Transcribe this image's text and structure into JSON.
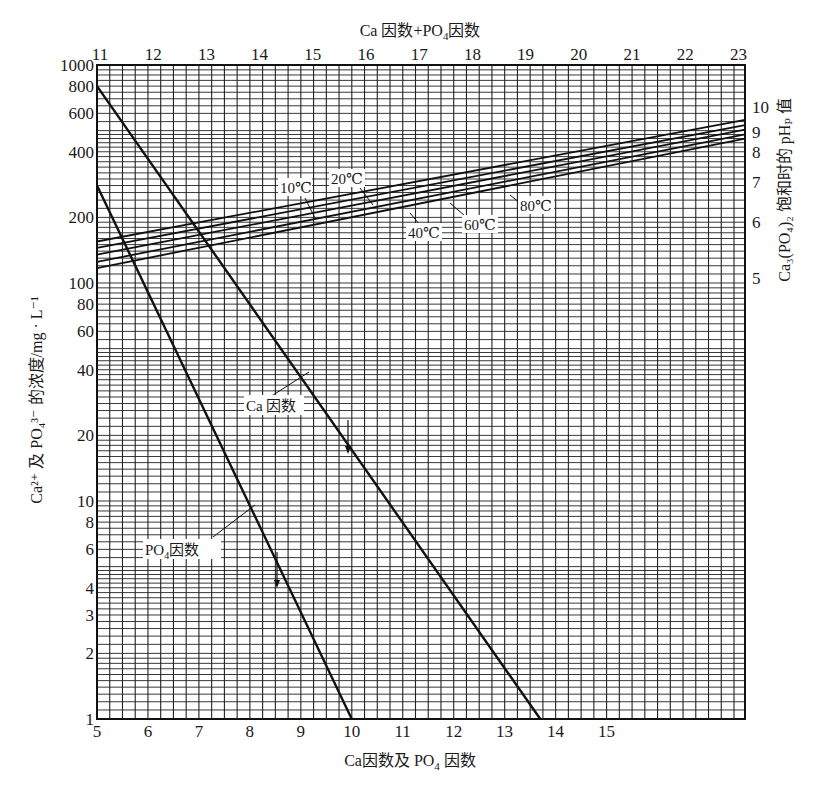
{
  "chart_data": {
    "type": "line",
    "title": "",
    "top_axis": {
      "label": "Ca因数+PO4因数",
      "ticks": [
        11,
        12,
        13,
        14,
        15,
        16,
        17,
        18,
        19,
        20,
        21,
        22,
        23
      ]
    },
    "bottom_axis": {
      "label": "Ca因数及 PO4 因数",
      "ticks": [
        5,
        6,
        7,
        8,
        9,
        10,
        11,
        12,
        13,
        14,
        15
      ],
      "range": [
        5,
        17.7
      ]
    },
    "left_axis": {
      "label": "Ca2+ 及 PO43- 的浓度/mg·L-1",
      "scale": "log",
      "ticks": [
        1,
        2,
        3,
        4,
        6,
        8,
        10,
        20,
        40,
        60,
        80,
        100,
        200,
        400,
        600,
        800,
        1000
      ],
      "range": [
        1,
        1000
      ]
    },
    "right_axis": {
      "label": "Ca3(PO4)2 饱和时的 pHP 值",
      "ticks": [
        5,
        6,
        7,
        8,
        9,
        10
      ]
    },
    "series": [
      {
        "name": "Ca因数",
        "x": [
          5,
          13.7
        ],
        "y": [
          800,
          1
        ],
        "axis": "bottom"
      },
      {
        "name": "PO4因数",
        "x": [
          5,
          10.0
        ],
        "y": [
          280,
          1
        ],
        "axis": "bottom"
      },
      {
        "name": "10℃",
        "x": [
          11,
          23
        ],
        "y": [
          155,
          560
        ],
        "axis": "top"
      },
      {
        "name": "20℃",
        "x": [
          11,
          23
        ],
        "y": [
          145,
          530
        ],
        "axis": "top"
      },
      {
        "name": "40℃",
        "x": [
          11,
          23
        ],
        "y": [
          135,
          505
        ],
        "axis": "top"
      },
      {
        "name": "60℃",
        "x": [
          11,
          23
        ],
        "y": [
          125,
          480
        ],
        "axis": "top"
      },
      {
        "name": "80℃",
        "x": [
          11,
          23
        ],
        "y": [
          117,
          460
        ],
        "axis": "top"
      }
    ],
    "annotations": [
      "10℃",
      "20℃",
      "40℃",
      "60℃",
      "80℃",
      "Ca因数",
      "PO4因数"
    ],
    "grid": true
  },
  "labels": {
    "top_title_a": "Ca 因数+PO",
    "top_title_sub": "4",
    "top_title_b": "因数",
    "bottom_title_a": "Ca因数及 PO",
    "bottom_title_sub": "4",
    "bottom_title_b": " 因数",
    "left_title": "Ca²⁺ 及 PO₄³⁻ 的浓度/mg · L⁻¹",
    "right_title": "Ca₃(PO₄)₂ 饱和时的 pHₚ 值",
    "t10": "10℃",
    "t20": "20℃",
    "t40": "40℃",
    "t60": "60℃",
    "t80": "80℃",
    "ca_label": "Ca 因数",
    "po4_label_a": "PO",
    "po4_label_sub": "4",
    "po4_label_b": "因数"
  }
}
